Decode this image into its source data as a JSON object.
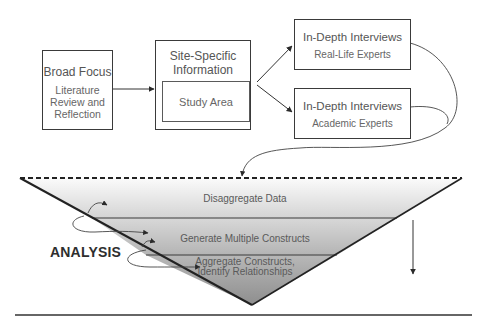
{
  "diagram": {
    "boxes": {
      "broad_focus": {
        "title": "Broad Focus",
        "subtitle_lines": [
          "Literature",
          "Review and",
          "Reflection"
        ]
      },
      "site_specific": {
        "title_lines": [
          "Site-Specific",
          "Information"
        ],
        "inner": "Study Area"
      },
      "interviews_real": {
        "title": "In-Depth Interviews",
        "subtitle": "Real-Life Experts"
      },
      "interviews_academic": {
        "title": "In-Depth Interviews",
        "subtitle": "Academic Experts"
      }
    },
    "funnel": {
      "label": "ANALYSIS",
      "bands": [
        {
          "label_lines": [
            "Disaggregate Data"
          ]
        },
        {
          "label_lines": [
            "Generate Multiple Constructs"
          ]
        },
        {
          "label_lines": [
            "Aggregate Constructs,",
            "Identify Relationships"
          ]
        }
      ]
    },
    "colors": {
      "line": "#2a2a2a",
      "band_top": "#f4f4f4",
      "band_mid": "#c8c8c8",
      "band_bottom": "#9a9a9a",
      "text": "#555555"
    }
  }
}
